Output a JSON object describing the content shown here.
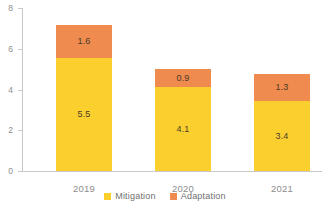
{
  "chart_data": {
    "type": "bar",
    "subtype": "stacked-bar",
    "title": "",
    "subtitle": "",
    "xlabel": "",
    "ylabel": "",
    "categories": [
      "2019",
      "2020",
      "2021"
    ],
    "series": [
      {
        "name": "Mitigation",
        "color": "#FBD02E",
        "values": [
          5.5,
          4.1,
          3.4
        ],
        "labels": [
          "5.5",
          "4.1",
          "3.4"
        ]
      },
      {
        "name": "Adaptation",
        "color": "#EF8B4E",
        "values": [
          1.6,
          0.9,
          1.3
        ],
        "labels": [
          "1.6",
          "0.9",
          "1.3"
        ]
      }
    ],
    "totals": [
      7.1,
      5.0,
      4.7
    ],
    "ylim": [
      0,
      8
    ],
    "yticks": [
      0,
      2,
      4,
      6,
      8
    ],
    "ytick_labels": [
      "0",
      "2",
      "4",
      "6",
      "8"
    ],
    "grid": false,
    "legend_position": "bottom-center"
  },
  "axes": {
    "y": {
      "ticks": [
        {
          "value": 8,
          "label": "8"
        },
        {
          "value": 6,
          "label": "6"
        },
        {
          "value": 4,
          "label": "4"
        },
        {
          "value": 2,
          "label": "2"
        },
        {
          "value": 0,
          "label": "0"
        }
      ]
    },
    "x": {
      "ticks": [
        {
          "label": "2019"
        },
        {
          "label": "2020"
        },
        {
          "label": "2021"
        }
      ]
    }
  },
  "bars": [
    {
      "category": "2019",
      "mitigation_label": "5.5",
      "adaptation_label": "1.6"
    },
    {
      "category": "2020",
      "mitigation_label": "4.1",
      "adaptation_label": "0.9"
    },
    {
      "category": "2021",
      "mitigation_label": "3.4",
      "adaptation_label": "1.3"
    }
  ],
  "legend": {
    "items": [
      {
        "label": "Mitigation",
        "color": "#FBD02E"
      },
      {
        "label": "Adaptation",
        "color": "#EF8B4E"
      }
    ]
  },
  "colors": {
    "mitigation": "#FBD02E",
    "adaptation": "#EF8B4E",
    "axis": "#C9C9C9",
    "axis_text": "#8D8D8D",
    "bar_label_text": "#4A3B2A",
    "legend_text": "#6F6F6F",
    "background": "#FFFFFF"
  }
}
